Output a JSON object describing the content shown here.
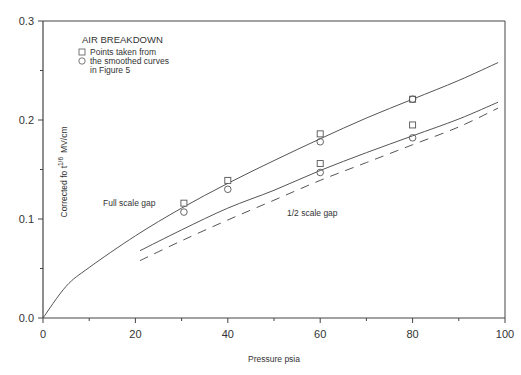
{
  "chart_data": {
    "type": "scatter",
    "title": "AIR BREAKDOWN",
    "xlabel": "Pressure psia",
    "ylabel": "Corrected fo t^1/6 MV/cm",
    "ylabel_parts": {
      "main": "Corrected fo t",
      "sup": "1/6",
      "unit": "MV/cm"
    },
    "xlim": [
      0,
      100
    ],
    "ylim": [
      0.0,
      0.3
    ],
    "x_ticks": [
      0,
      20,
      40,
      60,
      80,
      100
    ],
    "x_tick_labels": [
      "0",
      "20",
      "40",
      "60",
      "80",
      "100"
    ],
    "y_ticks": [
      0.0,
      0.1,
      0.2,
      0.3
    ],
    "y_tick_labels": [
      "0.0",
      "0.1",
      "0.2",
      "0.3"
    ],
    "grid": false,
    "legend": {
      "title": "AIR BREAKDOWN",
      "entries": [
        {
          "marker": "square",
          "label": "Points taken from"
        },
        {
          "marker": "circle",
          "label": "the smoothed curves"
        },
        {
          "marker": "none",
          "label": "in Figure 5"
        }
      ],
      "position": "upper-left"
    },
    "annotations": [
      {
        "text": "Full scale gap",
        "x": 17,
        "y": 0.115
      },
      {
        "text": "1/2 scale gap",
        "x": 58,
        "y": 0.094
      }
    ],
    "series": [
      {
        "name": "Full scale gap (curve)",
        "type": "line",
        "style": "solid",
        "x": [
          0,
          5,
          10,
          20,
          30,
          40,
          50,
          60,
          70,
          80,
          90,
          98.5
        ],
        "y": [
          0.0,
          0.032,
          0.051,
          0.083,
          0.111,
          0.136,
          0.159,
          0.181,
          0.202,
          0.221,
          0.24,
          0.258
        ]
      },
      {
        "name": "1/2 scale gap (curve)",
        "type": "line",
        "style": "solid",
        "x": [
          21,
          30,
          40,
          50,
          60,
          70,
          80,
          90,
          98.5
        ],
        "y": [
          0.068,
          0.089,
          0.111,
          0.129,
          0.149,
          0.167,
          0.184,
          0.201,
          0.218
        ]
      },
      {
        "name": "1/2 scale gap (dashed curve)",
        "type": "line",
        "style": "dashed",
        "x": [
          21,
          30,
          40,
          50,
          60,
          70,
          80,
          90,
          98.5
        ],
        "y": [
          0.058,
          0.078,
          0.099,
          0.119,
          0.139,
          0.157,
          0.175,
          0.193,
          0.212
        ]
      },
      {
        "name": "Full scale gap - points (square)",
        "type": "scatter",
        "marker": "square",
        "x": [
          30.5,
          40,
          60,
          80
        ],
        "y": [
          0.116,
          0.139,
          0.186,
          0.221
        ]
      },
      {
        "name": "Full scale gap - points (circle)",
        "type": "scatter",
        "marker": "circle",
        "x": [
          30.5,
          40,
          60,
          80
        ],
        "y": [
          0.107,
          0.13,
          0.178,
          0.221
        ]
      },
      {
        "name": "1/2 scale gap - points (square)",
        "type": "scatter",
        "marker": "square",
        "x": [
          60,
          80
        ],
        "y": [
          0.156,
          0.195
        ]
      },
      {
        "name": "1/2 scale gap - points (circle)",
        "type": "scatter",
        "marker": "circle",
        "x": [
          60,
          80
        ],
        "y": [
          0.147,
          0.182
        ]
      }
    ]
  },
  "layout": {
    "plot_left": 43,
    "plot_right": 505,
    "plot_top": 21,
    "plot_bottom": 318,
    "line_color": "#555555",
    "axis_color": "#444444"
  }
}
